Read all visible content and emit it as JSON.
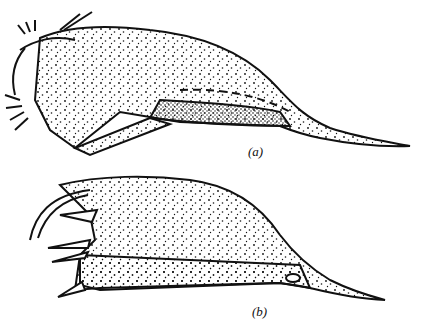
{
  "figures": [
    {
      "id": "a",
      "label": "(a)"
    },
    {
      "id": "b",
      "label": "(b)"
    }
  ],
  "colors": {
    "ink": "#111111",
    "paper": "#ffffff"
  }
}
